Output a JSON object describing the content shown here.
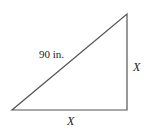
{
  "figure": {
    "type": "right-triangle",
    "vertices": {
      "bottom_left": [
        12,
        110
      ],
      "bottom_right": [
        127,
        110
      ],
      "top_right": [
        127,
        14
      ]
    },
    "stroke_color": "#555555",
    "labels": {
      "hypotenuse": "90 in.",
      "vertical_leg": "X",
      "horizontal_leg": "X"
    }
  }
}
